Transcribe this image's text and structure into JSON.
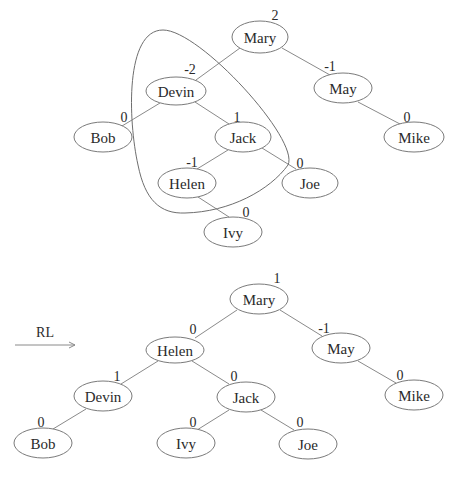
{
  "colors": {
    "edge": "#8a8a8a",
    "node_stroke": "#7a7a7a",
    "text": "#2a2a2a"
  },
  "before": {
    "caption": "Before rotation (unbalanced at Mary/Devin)",
    "nodes": [
      {
        "id": "Mary",
        "label": "Mary",
        "bf": "2",
        "cx": 260,
        "cy": 37,
        "rx": 28,
        "ry": 16,
        "bfx": 275,
        "bfy": 20
      },
      {
        "id": "Devin",
        "label": "Devin",
        "bf": "-2",
        "cx": 176,
        "cy": 91,
        "rx": 30,
        "ry": 14,
        "bfx": 190,
        "bfy": 74
      },
      {
        "id": "May",
        "label": "May",
        "bf": "-1",
        "cx": 343,
        "cy": 88,
        "rx": 29,
        "ry": 15,
        "bfx": 330,
        "bfy": 71
      },
      {
        "id": "Bob",
        "label": "Bob",
        "bf": "0",
        "cx": 103,
        "cy": 137,
        "rx": 29,
        "ry": 15,
        "bfx": 124,
        "bfy": 122
      },
      {
        "id": "Jack",
        "label": "Jack",
        "bf": "1",
        "cx": 243,
        "cy": 137,
        "rx": 28,
        "ry": 15,
        "bfx": 237,
        "bfy": 122
      },
      {
        "id": "Mike",
        "label": "Mike",
        "bf": "0",
        "cx": 414,
        "cy": 137,
        "rx": 30,
        "ry": 15,
        "bfx": 407,
        "bfy": 122
      },
      {
        "id": "Helen",
        "label": "Helen",
        "bf": "-1",
        "cx": 187,
        "cy": 183,
        "rx": 29,
        "ry": 15,
        "bfx": 192,
        "bfy": 167
      },
      {
        "id": "Joe",
        "label": "Joe",
        "bf": "0",
        "cx": 310,
        "cy": 183,
        "rx": 28,
        "ry": 15,
        "bfx": 300,
        "bfy": 168
      },
      {
        "id": "Ivy",
        "label": "Ivy",
        "bf": "0",
        "cx": 233,
        "cy": 232,
        "rx": 29,
        "ry": 15,
        "bfx": 246,
        "bfy": 217
      }
    ],
    "edges": [
      {
        "from": "Mary",
        "to": "Devin",
        "x1": 240,
        "y1": 48,
        "x2": 196,
        "y2": 80
      },
      {
        "from": "Mary",
        "to": "May",
        "x1": 282,
        "y1": 48,
        "x2": 330,
        "y2": 75
      },
      {
        "from": "Devin",
        "to": "Bob",
        "x1": 160,
        "y1": 103,
        "x2": 122,
        "y2": 126
      },
      {
        "from": "Devin",
        "to": "Jack",
        "x1": 195,
        "y1": 102,
        "x2": 229,
        "y2": 124
      },
      {
        "from": "May",
        "to": "Mike",
        "x1": 358,
        "y1": 102,
        "x2": 400,
        "y2": 124
      },
      {
        "from": "Jack",
        "to": "Helen",
        "x1": 228,
        "y1": 150,
        "x2": 197,
        "y2": 169
      },
      {
        "from": "Jack",
        "to": "Joe",
        "x1": 262,
        "y1": 148,
        "x2": 296,
        "y2": 169
      },
      {
        "from": "Helen",
        "to": "Ivy",
        "x1": 198,
        "y1": 197,
        "x2": 229,
        "y2": 217
      }
    ],
    "highlight_loop": "M 163 30 C 125 30, 128 120, 138 165 C 145 200, 160 214, 185 213 C 230 212, 270 190, 288 165 C 300 140, 200 30, 163 30 Z"
  },
  "transition": {
    "label": "RL",
    "arrow": {
      "x1": 15,
      "y1": 345,
      "x2": 75,
      "y2": 345
    }
  },
  "after": {
    "caption": "After RL rotation",
    "nodes": [
      {
        "id": "Mary",
        "label": "Mary",
        "bf": "1",
        "cx": 259,
        "cy": 299,
        "rx": 29,
        "ry": 15,
        "bfx": 277,
        "bfy": 283
      },
      {
        "id": "Helen",
        "label": "Helen",
        "bf": "0",
        "cx": 175,
        "cy": 350,
        "rx": 29,
        "ry": 13,
        "bfx": 193,
        "bfy": 334
      },
      {
        "id": "May",
        "label": "May",
        "bf": "-1",
        "cx": 341,
        "cy": 348,
        "rx": 29,
        "ry": 15,
        "bfx": 324,
        "bfy": 333
      },
      {
        "id": "Devin",
        "label": "Devin",
        "bf": "1",
        "cx": 103,
        "cy": 396,
        "rx": 29,
        "ry": 15,
        "bfx": 117,
        "bfy": 381
      },
      {
        "id": "Jack",
        "label": "Jack",
        "bf": "0",
        "cx": 246,
        "cy": 397,
        "rx": 29,
        "ry": 15,
        "bfx": 234,
        "bfy": 381
      },
      {
        "id": "Mike",
        "label": "Mike",
        "bf": "0",
        "cx": 414,
        "cy": 395,
        "rx": 29,
        "ry": 15,
        "bfx": 400,
        "bfy": 380
      },
      {
        "id": "Bob",
        "label": "Bob",
        "bf": "0",
        "cx": 43,
        "cy": 443,
        "rx": 29,
        "ry": 15,
        "bfx": 41,
        "bfy": 427
      },
      {
        "id": "Ivy",
        "label": "Ivy",
        "bf": "0",
        "cx": 186,
        "cy": 443,
        "rx": 29,
        "ry": 15,
        "bfx": 193,
        "bfy": 427
      },
      {
        "id": "Joe",
        "label": "Joe",
        "bf": "0",
        "cx": 308,
        "cy": 444,
        "rx": 29,
        "ry": 15,
        "bfx": 300,
        "bfy": 427
      }
    ],
    "edges": [
      {
        "from": "Mary",
        "to": "Helen",
        "x1": 237,
        "y1": 310,
        "x2": 195,
        "y2": 338
      },
      {
        "from": "Mary",
        "to": "May",
        "x1": 280,
        "y1": 310,
        "x2": 322,
        "y2": 336
      },
      {
        "from": "Helen",
        "to": "Devin",
        "x1": 158,
        "y1": 361,
        "x2": 121,
        "y2": 384
      },
      {
        "from": "Helen",
        "to": "Jack",
        "x1": 192,
        "y1": 361,
        "x2": 229,
        "y2": 384
      },
      {
        "from": "May",
        "to": "Mike",
        "x1": 358,
        "y1": 361,
        "x2": 396,
        "y2": 383
      },
      {
        "from": "Devin",
        "to": "Bob",
        "x1": 86,
        "y1": 409,
        "x2": 53,
        "y2": 429
      },
      {
        "from": "Jack",
        "to": "Ivy",
        "x1": 229,
        "y1": 410,
        "x2": 197,
        "y2": 430
      },
      {
        "from": "Jack",
        "to": "Joe",
        "x1": 261,
        "y1": 410,
        "x2": 294,
        "y2": 430
      }
    ]
  }
}
